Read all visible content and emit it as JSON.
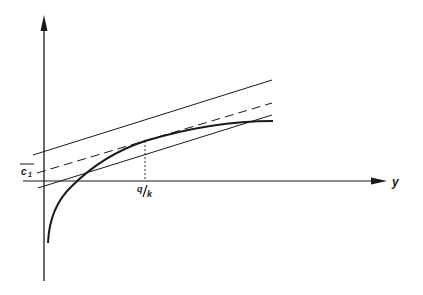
{
  "diagram": {
    "axes": {
      "horizontal_label": "y",
      "vertical_label": ""
    },
    "labels": {
      "intercept": "c",
      "intercept_subscript": "1",
      "tangent_x_num": "q",
      "tangent_x_den": "k"
    },
    "elements": [
      {
        "name": "upper-parallel-line",
        "style": "solid"
      },
      {
        "name": "tangent-line",
        "style": "dashed"
      },
      {
        "name": "lower-parallel-line",
        "style": "solid"
      },
      {
        "name": "concave-curve",
        "style": "solid-thick"
      },
      {
        "name": "tangent-drop-line",
        "style": "dotted"
      }
    ],
    "colors": {
      "ink": "#1a1a1a",
      "background": "#ffffff"
    }
  }
}
